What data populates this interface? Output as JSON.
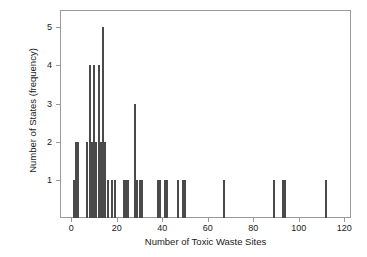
{
  "chart_data": {
    "type": "bar",
    "title": "",
    "subtitle": "",
    "xlabel": "Number of Toxic Waste Sites",
    "ylabel": "Number of States (frequency)",
    "xlim": [
      -5,
      123
    ],
    "ylim": [
      0,
      5.45
    ],
    "grid": false,
    "legend": null,
    "xticks": [
      0,
      20,
      40,
      60,
      80,
      100,
      120
    ],
    "xticklabels": [
      "0",
      "20",
      "40",
      "60",
      "80",
      "100",
      "120"
    ],
    "yticks": [
      1,
      2,
      3,
      4,
      5
    ],
    "yticklabels": [
      "1",
      "2",
      "3",
      "4",
      "5"
    ],
    "bar_color": "#4a4a4a",
    "frame_color": "#9a9a9a",
    "note": "Line/spike plot of frequency of number of toxic waste sites per state.",
    "x": [
      1,
      2,
      3,
      7,
      8,
      9,
      10,
      11,
      12,
      13,
      14,
      15,
      16,
      18,
      19,
      23,
      24,
      25,
      28,
      29,
      30,
      31,
      38,
      39,
      41,
      42,
      47,
      49,
      50,
      67,
      89,
      93,
      94,
      112
    ],
    "values": [
      1,
      2,
      2,
      2,
      4,
      2,
      4,
      2,
      4,
      2,
      5,
      2,
      1,
      1,
      1,
      1,
      1,
      1,
      3,
      1,
      1,
      1,
      1,
      1,
      1,
      1,
      1,
      1,
      1,
      1,
      1,
      1,
      1,
      1
    ],
    "points": [
      {
        "x": 1,
        "y": 1
      },
      {
        "x": 2,
        "y": 2
      },
      {
        "x": 3,
        "y": 2
      },
      {
        "x": 7,
        "y": 2
      },
      {
        "x": 8,
        "y": 4
      },
      {
        "x": 9,
        "y": 2
      },
      {
        "x": 10,
        "y": 4
      },
      {
        "x": 11,
        "y": 2
      },
      {
        "x": 12,
        "y": 4
      },
      {
        "x": 13,
        "y": 2
      },
      {
        "x": 14,
        "y": 5
      },
      {
        "x": 15,
        "y": 2
      },
      {
        "x": 16,
        "y": 1
      },
      {
        "x": 18,
        "y": 1
      },
      {
        "x": 19,
        "y": 1
      },
      {
        "x": 23,
        "y": 1
      },
      {
        "x": 24,
        "y": 1
      },
      {
        "x": 25,
        "y": 1
      },
      {
        "x": 28,
        "y": 3
      },
      {
        "x": 29,
        "y": 1
      },
      {
        "x": 30,
        "y": 1
      },
      {
        "x": 31,
        "y": 1
      },
      {
        "x": 38,
        "y": 1
      },
      {
        "x": 39,
        "y": 1
      },
      {
        "x": 41,
        "y": 1
      },
      {
        "x": 42,
        "y": 1
      },
      {
        "x": 47,
        "y": 1
      },
      {
        "x": 49,
        "y": 1
      },
      {
        "x": 50,
        "y": 1
      },
      {
        "x": 67,
        "y": 1
      },
      {
        "x": 89,
        "y": 1
      },
      {
        "x": 93,
        "y": 1
      },
      {
        "x": 94,
        "y": 1
      },
      {
        "x": 112,
        "y": 1
      }
    ]
  }
}
